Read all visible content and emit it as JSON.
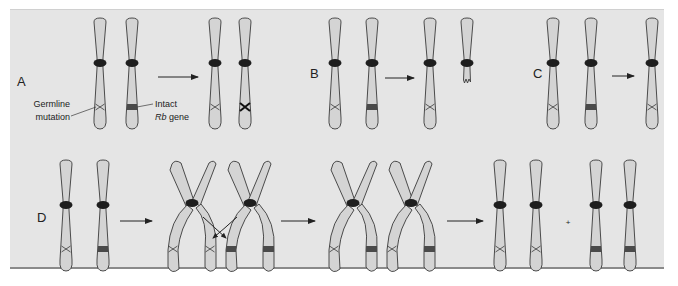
{
  "figure": {
    "background": "#e5e5e5",
    "chromosome_fill": "#d4d4d4",
    "outline": "#3a3a3a",
    "gene_band": "#4a4a4a"
  },
  "panels": {
    "A": {
      "label": "A"
    },
    "B": {
      "label": "B"
    },
    "C": {
      "label": "C"
    },
    "D": {
      "label": "D"
    }
  },
  "annotations": {
    "germline_line1": "Germline",
    "germline_line2": "mutation",
    "intact_line1": "Intact",
    "intact_rb": "Rb",
    "intact_gene": " gene"
  },
  "symbols": {
    "plus": "+"
  }
}
